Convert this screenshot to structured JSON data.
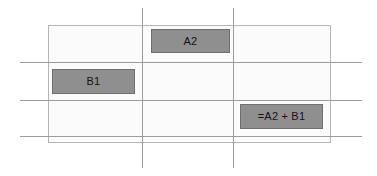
{
  "diagram": {
    "sheet": {
      "name": "worksheet-grid",
      "background": "#fbfbfb",
      "border_color": "#b4b4b4"
    },
    "grid": {
      "line_color": "#9c9c9c",
      "horizontal_rows": 3,
      "vertical_columns": 2
    },
    "cells": [
      {
        "id": "a2",
        "label": "A2",
        "fill": "#8f8f8f",
        "border": "#6f6f6f",
        "role": "operand"
      },
      {
        "id": "b1",
        "label": "B1",
        "fill": "#8f8f8f",
        "border": "#6f6f6f",
        "role": "operand"
      },
      {
        "id": "formula",
        "label": "=A2 + B1",
        "fill": "#8f8f8f",
        "border": "#6f6f6f",
        "role": "formula-result"
      }
    ]
  }
}
